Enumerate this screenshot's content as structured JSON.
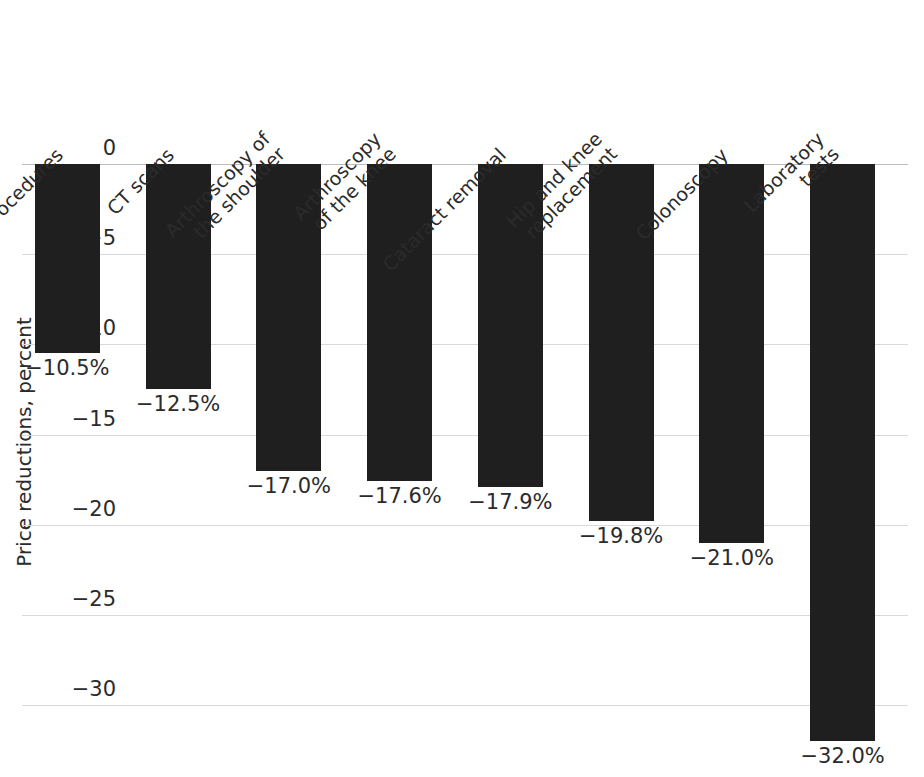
{
  "chart_data": {
    "type": "bar",
    "title": "",
    "xlabel": "",
    "ylabel": "Price reductions, percent",
    "ylim": [
      -33.5,
      0
    ],
    "grid": true,
    "legend": "none",
    "orientation": "vertical",
    "bar_color": "#1f1f1f",
    "gridline_color": "#d9d9d9",
    "value_format": "percent_one_decimal_negative",
    "categories": [
      "MRI procedures",
      "CT scans",
      "Arthroscopy of the shoulder",
      "Arthroscopy of the knee",
      "Cataract removal",
      "Hip and knee replacement",
      "Colonoscopy",
      "Laboratory tests"
    ],
    "category_lines": [
      [
        "MRI procedures"
      ],
      [
        "CT scans"
      ],
      [
        "Arthroscopy of",
        "the shoulder"
      ],
      [
        "Arthroscopy",
        "of the knee"
      ],
      [
        "Cataract removal"
      ],
      [
        "Hip and knee",
        "replacement"
      ],
      [
        "Colonoscopy"
      ],
      [
        "Laboratory",
        "tests"
      ]
    ],
    "values": [
      -10.5,
      -12.5,
      -17.0,
      -17.6,
      -17.9,
      -19.8,
      -21.0,
      -32.0
    ],
    "data_labels": [
      "−10.5%",
      "−12.5%",
      "−17.0%",
      "−17.6%",
      "−17.9%",
      "−19.8%",
      "−21.0%",
      "−32.0%"
    ],
    "yticks": [
      0,
      -5,
      -10,
      -15,
      -20,
      -25,
      -30
    ],
    "ytick_labels": [
      "0",
      "−5",
      "−10",
      "−15",
      "−20",
      "−25",
      "−30"
    ]
  }
}
